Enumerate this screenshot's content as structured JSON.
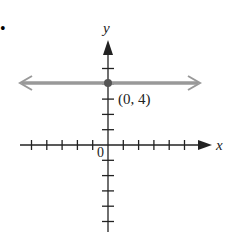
{
  "bullet": "•",
  "chart_data": {
    "type": "line",
    "title": "",
    "xlabel": "x",
    "ylabel": "y",
    "origin_label": "0",
    "series": [
      {
        "name": "y = 4",
        "x": [
          -5,
          5
        ],
        "y": [
          4,
          4
        ],
        "color": "#999999"
      }
    ],
    "point": {
      "x": 0,
      "y": 4,
      "label": "(0, 4)"
    },
    "xlim": [
      -5,
      5
    ],
    "ylim": [
      -5,
      5
    ],
    "grid": false,
    "x_ticks": [
      -5,
      -4,
      -3,
      -2,
      -1,
      1,
      2,
      3,
      4,
      5
    ],
    "y_ticks": [
      -5,
      -4,
      -3,
      -2,
      -1,
      1,
      2,
      3,
      4,
      5
    ]
  }
}
